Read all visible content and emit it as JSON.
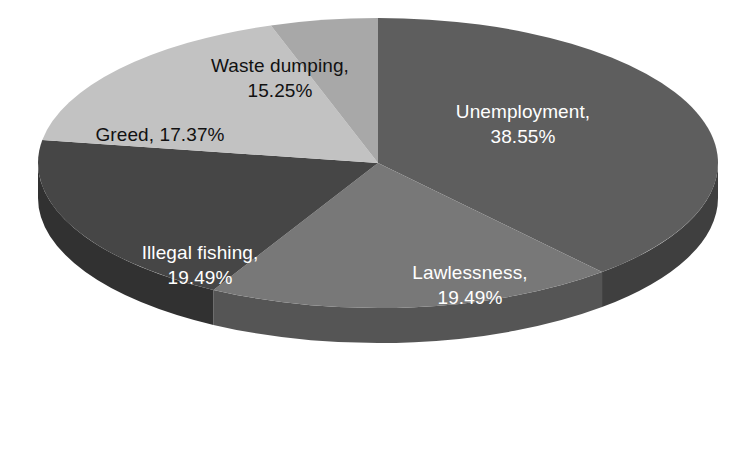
{
  "chart_data": {
    "type": "pie",
    "title": "",
    "subtitle": "",
    "xlabel": "",
    "ylabel": "",
    "grid": false,
    "legend_position": "none",
    "label_format": "{name}, {value}%",
    "start_angle_deg": 0,
    "direction": "clockwise",
    "three_d": true,
    "categories": [
      "Unemployment",
      "Lawlessness",
      "Illegal fishing",
      "Greed",
      "Waste dumping"
    ],
    "values": [
      38.55,
      19.49,
      19.49,
      17.37,
      15.25
    ],
    "slices": [
      {
        "name": "Unemployment",
        "value": 38.55,
        "value_text": "38.55%",
        "label_line1": "Unemployment,",
        "label_line2": "38.55%",
        "color": "#5e5e5e",
        "side_color": "#3f3f3f",
        "label_color": "#ffffff",
        "start_deg": 0,
        "end_deg": 138.78
      },
      {
        "name": "Lawlessness",
        "value": 19.49,
        "value_text": "19.49%",
        "label_line1": "Lawlessness,",
        "label_line2": "19.49%",
        "color": "#787878",
        "side_color": "#555555",
        "label_color": "#ffffff",
        "start_deg": 138.78,
        "end_deg": 208.94
      },
      {
        "name": "Illegal fishing",
        "value": 19.49,
        "value_text": "19.49%",
        "label_line1": "Illegal fishing,",
        "label_line2": "19.49%",
        "color": "#464646",
        "side_color": "#313131",
        "label_color": "#ffffff",
        "start_deg": 208.94,
        "end_deg": 279.11
      },
      {
        "name": "Greed",
        "value": 17.37,
        "value_text": "17.37%",
        "label_line1": "Greed, 17.37%",
        "label_line2": "",
        "color": "#c2c2c2",
        "side_color": "#8f8f8f",
        "label_color": "#111111",
        "start_deg": 279.11,
        "end_deg": 341.64
      },
      {
        "name": "Waste dumping",
        "value": 15.25,
        "value_text": "15.25%",
        "label_line1": "Waste dumping,",
        "label_line2": "15.25%",
        "color": "#a8a8a8",
        "side_color": "#7d7d7d",
        "label_color": "#111111",
        "start_deg": 341.64,
        "end_deg": 360
      }
    ],
    "background_color": "#ffffff"
  }
}
